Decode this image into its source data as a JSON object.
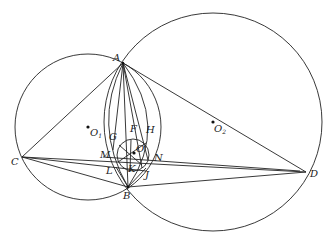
{
  "diagram": {
    "type": "geometry",
    "points": {
      "A": {
        "label": "A",
        "x": 123,
        "y": 63
      },
      "B": {
        "label": "B",
        "x": 128,
        "y": 187
      },
      "C": {
        "label": "C",
        "x": 22,
        "y": 157
      },
      "D": {
        "label": "D",
        "x": 306,
        "y": 172
      },
      "O1": {
        "label": "O",
        "sub": "1",
        "x": 88,
        "y": 127
      },
      "O2": {
        "label": "O",
        "sub": "2",
        "x": 213,
        "y": 122
      },
      "O": {
        "label": "O",
        "x": 135,
        "y": 153
      },
      "F": {
        "label": "F",
        "x": 133,
        "y": 124
      },
      "G": {
        "label": "G",
        "x": 113,
        "y": 137
      },
      "H": {
        "label": "H",
        "x": 150,
        "y": 131
      },
      "M": {
        "label": "M",
        "x": 101,
        "y": 154
      },
      "N": {
        "label": "N",
        "x": 156,
        "y": 158
      },
      "L": {
        "label": "L",
        "x": 107,
        "y": 171
      },
      "K": {
        "label": "K",
        "x": 129,
        "y": 169
      },
      "J": {
        "label": "J",
        "x": 146,
        "y": 176
      }
    },
    "circles": [
      {
        "name": "circle-O1",
        "cx": 88,
        "cy": 127,
        "r": 73
      },
      {
        "name": "circle-O2",
        "cx": 213,
        "cy": 122,
        "r": 109
      },
      {
        "name": "incircle-O",
        "cx": 133,
        "cy": 155,
        "r": 16
      }
    ]
  }
}
